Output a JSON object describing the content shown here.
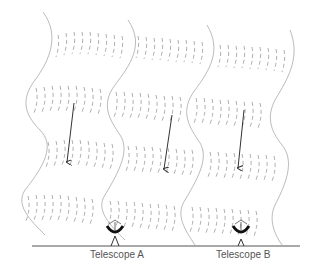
{
  "diagram": {
    "ground_color": "#555555",
    "ink_color": "#999999",
    "arrow_color": "#333333",
    "telescopes": [
      {
        "label": "Telescope A",
        "x": 115,
        "y": 247
      },
      {
        "label": "Telescope B",
        "x": 241,
        "y": 247
      }
    ],
    "columns": 3,
    "arrows": [
      {
        "x1": 74,
        "y1": 103,
        "x2": 67,
        "y2": 162
      },
      {
        "x1": 172,
        "y1": 115,
        "x2": 164,
        "y2": 169
      },
      {
        "x1": 244,
        "y1": 110,
        "x2": 238,
        "y2": 168
      }
    ]
  }
}
